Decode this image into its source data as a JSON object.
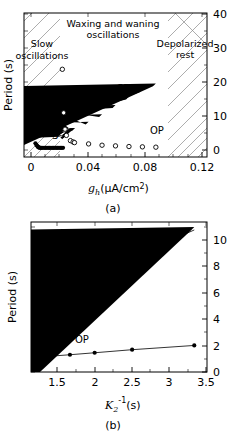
{
  "figure": {
    "panel_a_caption": "(a)",
    "panel_b_caption": "(b)"
  },
  "panel_a": {
    "ylabel": "Period (s)",
    "xlabel_main": "g",
    "xlabel_sub": "h",
    "xlabel_units": "(μA/cm",
    "xlabel_exp": "2",
    "xlabel_close": ")",
    "region_labels": [
      {
        "id": "slow",
        "line1": "Slow",
        "line2": "oscillations"
      },
      {
        "id": "waxing",
        "line1": "Waxing and waning",
        "line2": "oscillations"
      },
      {
        "id": "depolarized",
        "line1": "Depolarized",
        "line2": "rest"
      }
    ],
    "series_labels": [
      {
        "id": "S",
        "text": "S"
      },
      {
        "id": "SP",
        "text": "SP"
      },
      {
        "id": "OP",
        "text": "OP"
      }
    ],
    "xticks": [
      "0",
      "0.04",
      "0.08",
      "0.12"
    ],
    "yticks": [
      "0",
      "10",
      "20",
      "30",
      "40"
    ]
  },
  "panel_b": {
    "ylabel": "Period (s)",
    "xlabel_main": "K",
    "xlabel_sub": "2",
    "xlabel_sup": "-1",
    "xlabel_units": "(s)",
    "series_labels": [
      {
        "id": "SP",
        "text": "SP"
      },
      {
        "id": "OP",
        "text": "OP"
      }
    ],
    "xticks": [
      "1.5",
      "2",
      "2.5",
      "3",
      "3.5"
    ],
    "yticks": [
      "0",
      "2",
      "4",
      "6",
      "8",
      "10"
    ]
  },
  "chart_data": [
    {
      "type": "scatter",
      "panel": "a",
      "title": "",
      "xlabel": "g_h (μA/cm^2)",
      "ylabel": "Period (s)",
      "xlim": [
        -0.008,
        0.128
      ],
      "ylim": [
        -2,
        42
      ],
      "xticks": [
        0,
        0.04,
        0.08,
        0.12
      ],
      "yticks": [
        0,
        10,
        20,
        30,
        40
      ],
      "yaxis_side": "right",
      "grid": false,
      "legend": "none",
      "shaded_regions": [
        {
          "label": "Slow oscillations",
          "x_start": 0.0,
          "x_end": 0.0225,
          "hatch": "diagonal"
        },
        {
          "label": "Waxing and waning oscillations",
          "x_start": 0.0225,
          "x_end": 0.0895,
          "hatch": "none"
        },
        {
          "label": "Depolarized rest",
          "x_start": 0.0895,
          "x_end": 0.125,
          "hatch": "diagonal"
        }
      ],
      "series": [
        {
          "name": "S",
          "marker": "filled-circle",
          "x": [
            0.0005,
            0.0012,
            0.0018,
            0.0022,
            0.0026,
            0.003,
            0.0035,
            0.0042,
            0.005,
            0.006,
            0.007,
            0.008,
            0.009,
            0.01,
            0.011,
            0.012,
            0.013,
            0.014,
            0.015,
            0.016,
            0.017,
            0.018,
            0.019,
            0.02,
            0.021
          ],
          "y": [
            2.2,
            1.7,
            1.4,
            1.2,
            1.0,
            0.9,
            0.85,
            0.8,
            0.8,
            0.8,
            0.8,
            0.8,
            0.8,
            0.8,
            0.8,
            0.8,
            0.8,
            0.8,
            0.8,
            0.8,
            0.8,
            0.8,
            0.8,
            0.8,
            0.8
          ]
        },
        {
          "name": "SP-lower-cluster",
          "marker": "filled-triangle",
          "x": [
            0.0225,
            0.0235,
            0.0245,
            0.0255,
            0.0262,
            0.027,
            0.0278,
            0.0285,
            0.0292,
            0.03
          ],
          "y": [
            3.4,
            3.8,
            4.2,
            4.6,
            4.9,
            5.2,
            5.5,
            5.7,
            5.9,
            6.0
          ]
        },
        {
          "name": "SP",
          "marker": "filled-triangle",
          "x": [
            0.04,
            0.05,
            0.06,
            0.07,
            0.08,
            0.09
          ],
          "y": [
            7.9,
            10.2,
            13.0,
            15.6,
            17.8,
            19.6
          ]
        },
        {
          "name": "OP-cluster",
          "marker": "open-circle",
          "x": [
            0.0205,
            0.0215,
            0.0225,
            0.0235,
            0.0265,
            0.0285,
            0.0295
          ],
          "y": [
            24.8,
            11.5,
            6.5,
            4.6,
            3.0,
            2.6,
            2.4
          ]
        },
        {
          "name": "OP",
          "marker": "open-circle",
          "x": [
            0.04,
            0.05,
            0.06,
            0.07,
            0.08,
            0.09
          ],
          "y": [
            2.0,
            1.6,
            1.4,
            1.2,
            1.1,
            1.0
          ]
        }
      ]
    },
    {
      "type": "line",
      "panel": "b",
      "title": "",
      "xlabel": "K_2^-1 (s)",
      "ylabel": "Period (s)",
      "xlim": [
        1.15,
        3.5
      ],
      "ylim": [
        0,
        11.3
      ],
      "xticks": [
        1.5,
        2,
        2.5,
        3,
        3.5
      ],
      "yticks": [
        0,
        2,
        4,
        6,
        8,
        10
      ],
      "yaxis_side": "right",
      "grid": false,
      "legend": "none",
      "series": [
        {
          "name": "SP",
          "marker": "filled-triangle",
          "line": true,
          "x": [
            1.22,
            1.43,
            1.67,
            2.0,
            2.5,
            3.33
          ],
          "y": [
            5.8,
            6.2,
            6.65,
            7.35,
            8.65,
            10.7
          ]
        },
        {
          "name": "OP",
          "marker": "filled-circle",
          "line": true,
          "x": [
            1.22,
            1.43,
            1.67,
            2.0,
            2.5,
            3.33
          ],
          "y": [
            1.1,
            1.2,
            1.3,
            1.45,
            1.68,
            2.0
          ]
        }
      ]
    }
  ]
}
